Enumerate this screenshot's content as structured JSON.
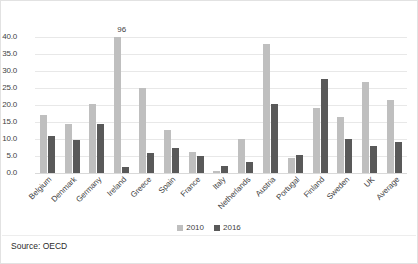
{
  "chart_data": {
    "type": "bar",
    "title": "",
    "xlabel": "",
    "ylabel": "",
    "ylim": [
      0,
      40
    ],
    "ytick_step": 5,
    "grid": true,
    "legend_position": "bottom",
    "categories": [
      "Belgium",
      "Denmark",
      "Germany",
      "Ireland",
      "Greece",
      "Spain",
      "France",
      "Italy",
      "Netherlands",
      "Austria",
      "Portugal",
      "Finland",
      "Sweden",
      "UK",
      "Average"
    ],
    "ytick_labels": [
      "0.0",
      "5.0",
      "10.0",
      "15.0",
      "20.0",
      "25.0",
      "30.0",
      "35.0",
      "40.0"
    ],
    "series": [
      {
        "name": "2010",
        "color": "#bfbfbf",
        "values": [
          17.0,
          14.5,
          20.2,
          96.0,
          25.1,
          12.6,
          6.3,
          0.7,
          10.1,
          37.9,
          4.3,
          19.2,
          16.5,
          26.8,
          21.5
        ]
      },
      {
        "name": "2016",
        "color": "#595959",
        "values": [
          10.9,
          9.8,
          14.3,
          1.7,
          5.9,
          7.5,
          5.0,
          2.2,
          3.3,
          20.2,
          5.2,
          27.6,
          9.9,
          7.8,
          9.0
        ]
      }
    ],
    "annotations": [
      {
        "category": "Ireland",
        "series": "2010",
        "label": "96",
        "note": "bar truncated at axis maximum"
      }
    ]
  },
  "footer": {
    "source": "Source: OECD"
  }
}
